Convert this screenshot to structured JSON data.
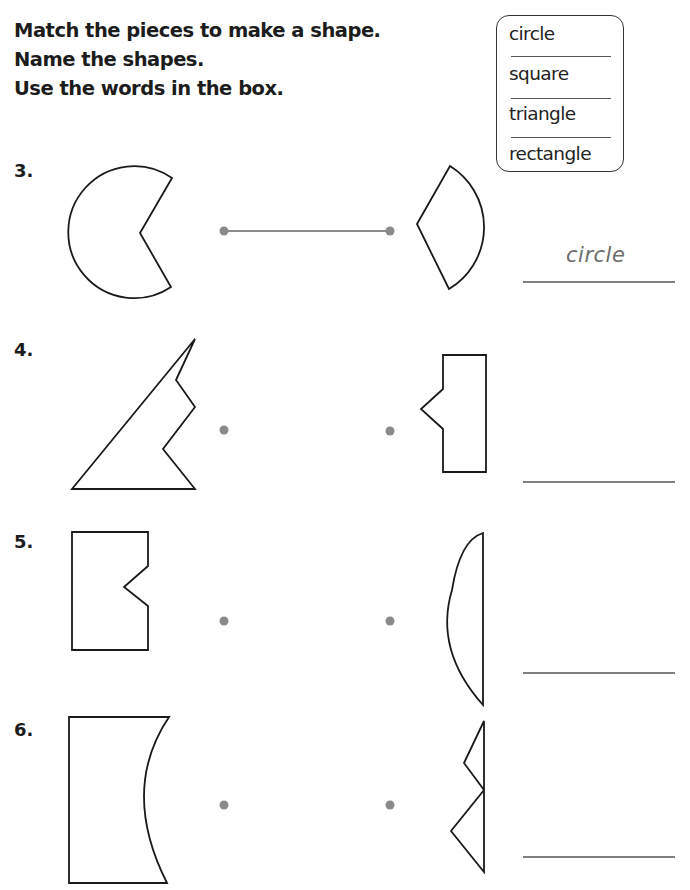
{
  "instructions": [
    "Match the pieces to make a shape.",
    "Name the shapes.",
    "Use the words in the box."
  ],
  "word_box": {
    "words": [
      "circle",
      "square",
      "triangle",
      "rectangle"
    ]
  },
  "problems": [
    {
      "number": "3.",
      "left_piece": "circle-piece-pacman",
      "right_piece": "circle-piece-wedge",
      "matched": true,
      "answer": "circle"
    },
    {
      "number": "4.",
      "left_piece": "triangle-piece-left",
      "right_piece": "rectangle-piece-notched",
      "matched": false,
      "answer": ""
    },
    {
      "number": "5.",
      "left_piece": "rectangle-piece-notched",
      "right_piece": "circle-piece-segment",
      "matched": false,
      "answer": ""
    },
    {
      "number": "6.",
      "left_piece": "rectangle-piece-concave",
      "right_piece": "triangle-piece-zigzag",
      "matched": false,
      "answer": ""
    }
  ],
  "colors": {
    "ink": "#1a1a1a",
    "dot": "#8a8a8a",
    "match_line": "#8a8a8a",
    "answer_text": "#6e6e6e"
  }
}
